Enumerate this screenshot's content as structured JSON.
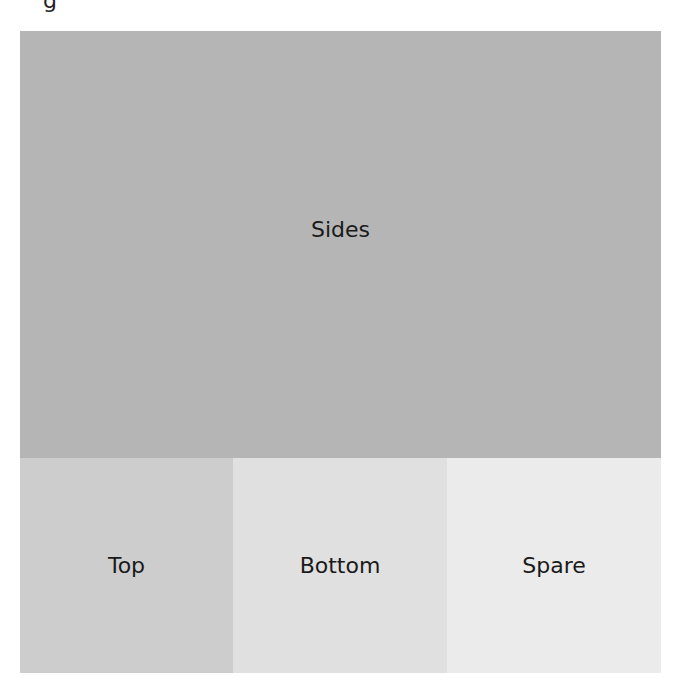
{
  "clipped_text": "g",
  "diagram": {
    "regions": [
      {
        "id": "sides",
        "label": "Sides",
        "color": "#b5b5b5"
      },
      {
        "id": "top",
        "label": "Top",
        "color": "#cdcdcd"
      },
      {
        "id": "bottom",
        "label": "Bottom",
        "color": "#e0e0e0"
      },
      {
        "id": "spare",
        "label": "Spare",
        "color": "#ebebeb"
      }
    ]
  }
}
